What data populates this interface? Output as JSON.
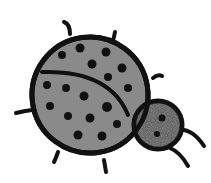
{
  "image": {
    "subject": "ladybug",
    "description": "Black-outline cartoon drawing of a spotted ladybug with a gray shell and darker speckled head",
    "colors": {
      "background": "#ffffff",
      "outline": "#111111",
      "shell": "#8a8a8a",
      "head": "#555555",
      "spots": "#111111"
    }
  }
}
